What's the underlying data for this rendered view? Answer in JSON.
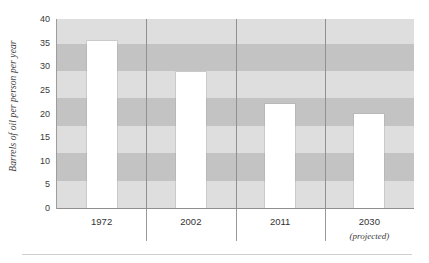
{
  "chart_data": {
    "type": "bar",
    "title": "",
    "xlabel": "",
    "ylabel": "Barrels of oil per person per year",
    "categories": [
      "1972",
      "2002",
      "2011",
      "2030"
    ],
    "category_notes": [
      "",
      "",
      "",
      "(projected)"
    ],
    "values": [
      35.3,
      28.7,
      22.0,
      20.0
    ],
    "ylim": [
      0,
      40
    ],
    "ytick_labels": [
      "0",
      "5",
      "10",
      "15",
      "20",
      "25",
      "30",
      "35",
      "40"
    ],
    "ytick_values": [
      0,
      5,
      10,
      15,
      20,
      25,
      30,
      35,
      40
    ],
    "grid": false,
    "legend": "none",
    "bar_color": "#ffffff",
    "band_color_light": "#dedede",
    "band_color_dark": "#c3c3c3",
    "separator_color": "#8e8e8e",
    "axis_color": "#8f8f8f",
    "text_color": "#333333",
    "background_bands": [
      {
        "from": 0.0,
        "to": 5.8,
        "shade": "light"
      },
      {
        "from": 5.8,
        "to": 11.6,
        "shade": "dark"
      },
      {
        "from": 11.6,
        "to": 17.4,
        "shade": "light"
      },
      {
        "from": 17.4,
        "to": 23.2,
        "shade": "dark"
      },
      {
        "from": 23.2,
        "to": 29.0,
        "shade": "light"
      },
      {
        "from": 29.0,
        "to": 34.8,
        "shade": "dark"
      },
      {
        "from": 34.8,
        "to": 40.0,
        "shade": "light"
      }
    ]
  }
}
